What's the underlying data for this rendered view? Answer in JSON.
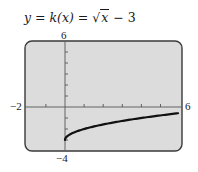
{
  "title": {
    "lhs": "y = ",
    "fname": "k",
    "arg": "(x) = ",
    "sqrt_sym": "√",
    "radicand": "x",
    "rest": " − 3"
  },
  "labels": {
    "y_max": "6",
    "y_min": "−4",
    "x_min": "−2",
    "x_max": "6"
  },
  "colors": {
    "screen_bg": "#dcdcdc",
    "screen_border": "#3a3a3a",
    "curve": "#111111",
    "axis": "#555555"
  },
  "chart_data": {
    "type": "line",
    "title": "y = k(x) = √x − 3",
    "xlabel": "",
    "ylabel": "",
    "xlim": [
      -2,
      6
    ],
    "ylim": [
      -4,
      6
    ],
    "xscale_ticks": 1,
    "yscale_ticks": 1,
    "grid": false,
    "series": [
      {
        "name": "k(x) = sqrt(x) - 3",
        "x": [
          0,
          0.25,
          0.5,
          1,
          1.5,
          2,
          3,
          4,
          5,
          6
        ],
        "y": [
          -3,
          -2.5,
          -2.29,
          -2,
          -1.78,
          -1.59,
          -1.27,
          -1,
          -0.76,
          -0.55
        ]
      }
    ],
    "window_labels": {
      "xmin": "-2",
      "xmax": "6",
      "ymin": "-4",
      "ymax": "6"
    }
  }
}
